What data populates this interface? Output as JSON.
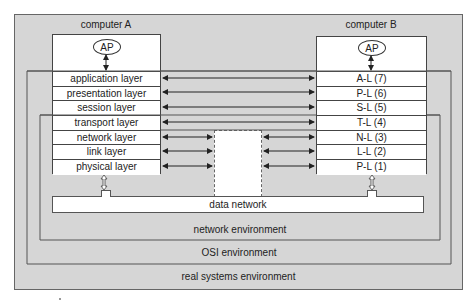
{
  "computer_a": {
    "title": "computer A",
    "ap": "AP",
    "layers": [
      "application layer",
      "presentation layer",
      "session layer",
      "transport layer",
      "network layer",
      "link layer",
      "physical layer"
    ]
  },
  "computer_b": {
    "title": "computer B",
    "ap": "AP",
    "layers": [
      "A-L (7)",
      "P-L (6)",
      "S-L (5)",
      "T-L (4)",
      "N-L (3)",
      "L-L (2)",
      "P-L (1)"
    ]
  },
  "data_network": "data network",
  "environments": {
    "network": "network environment",
    "osi": "OSI environment",
    "real": "real systems environment"
  },
  "colors": {
    "background_gray": "#d6d6d6",
    "box_white": "#ffffff",
    "line": "#444444"
  }
}
